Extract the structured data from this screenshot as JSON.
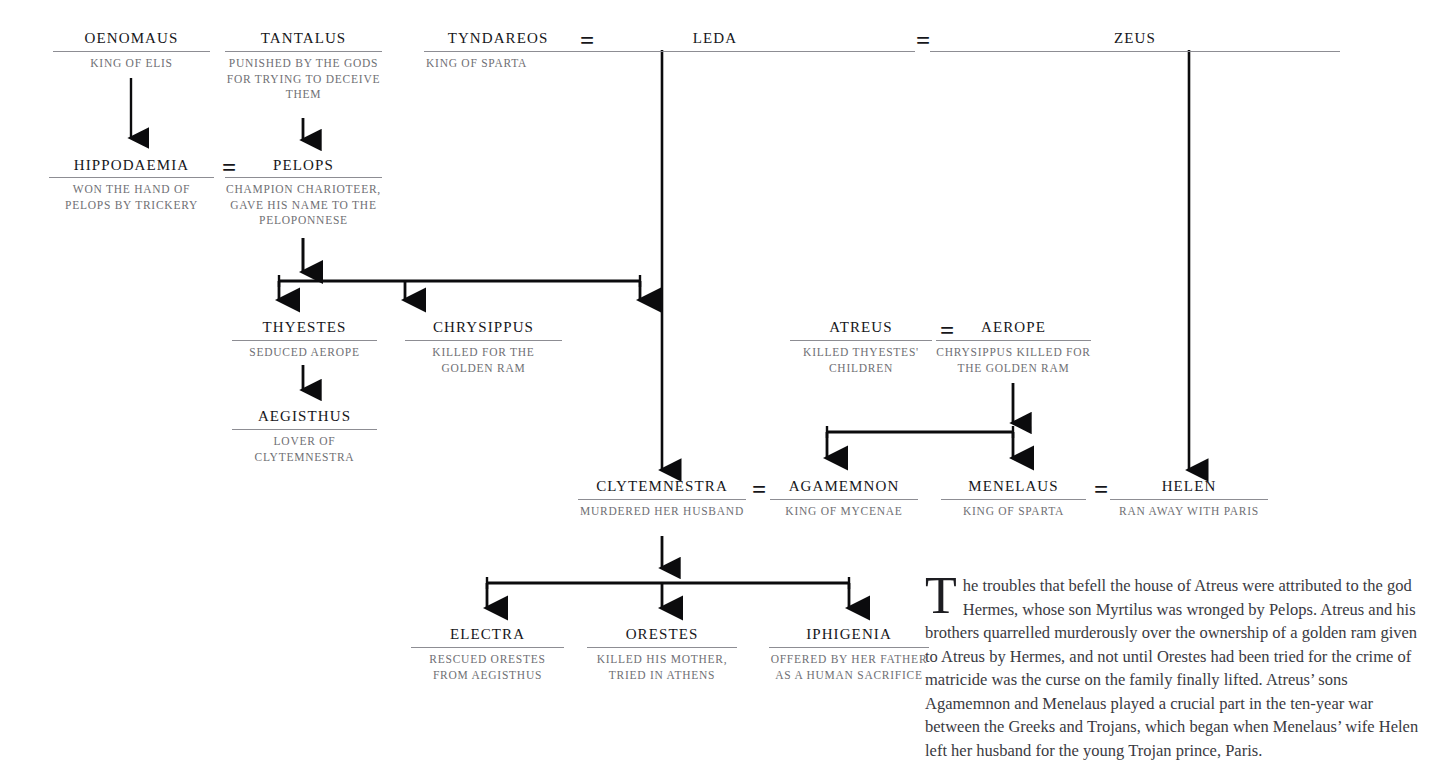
{
  "people": [
    {
      "id": "oenomaus",
      "name": "Oenomaus",
      "desc": "King of Elis"
    },
    {
      "id": "tantalus",
      "name": "Tantalus",
      "desc": "Punished by the gods for trying to deceive them"
    },
    {
      "id": "tyndareos",
      "name": "Tyndareos",
      "desc": "King of Sparta"
    },
    {
      "id": "leda",
      "name": "Leda",
      "desc": ""
    },
    {
      "id": "zeus",
      "name": "Zeus",
      "desc": ""
    },
    {
      "id": "hippodaemia",
      "name": "Hippodaemia",
      "desc": "Won the hand of Pelops by trickery"
    },
    {
      "id": "pelops",
      "name": "Pelops",
      "desc": "Champion charioteer, gave his name to the Peloponnese"
    },
    {
      "id": "thyestes",
      "name": "Thyestes",
      "desc": "Seduced Aerope"
    },
    {
      "id": "chrysippus",
      "name": "Chrysippus",
      "desc": "Killed for the golden ram"
    },
    {
      "id": "atreus",
      "name": "Atreus",
      "desc": "Killed Thyestes' children"
    },
    {
      "id": "aerope",
      "name": "Aerope",
      "desc": "Chrysippus killed for the golden ram"
    },
    {
      "id": "aegisthus",
      "name": "Aegisthus",
      "desc": "Lover of Clytemnestra"
    },
    {
      "id": "clytemnestra",
      "name": "Clytemnestra",
      "desc": "Murdered her husband"
    },
    {
      "id": "agamemnon",
      "name": "Agamemnon",
      "desc": "King of Mycenae"
    },
    {
      "id": "menelaus",
      "name": "Menelaus",
      "desc": "King of Sparta"
    },
    {
      "id": "helen",
      "name": "Helen",
      "desc": "Ran away with Paris"
    },
    {
      "id": "electra",
      "name": "Electra",
      "desc": "Rescued Orestes from Aegisthus"
    },
    {
      "id": "orestes",
      "name": "Orestes",
      "desc": "Killed his mother, tried in Athens"
    },
    {
      "id": "iphigenia",
      "name": "Iphigenia",
      "desc": "Offered by her father as a human sacrifice"
    }
  ],
  "marriages": [
    {
      "id": "tyndareos-leda",
      "symbol": "="
    },
    {
      "id": "leda-zeus",
      "symbol": "="
    },
    {
      "id": "hippodaemia-pelops",
      "symbol": "="
    },
    {
      "id": "atreus-aerope",
      "symbol": "="
    },
    {
      "id": "clytemnestra-agamemnon",
      "symbol": "="
    },
    {
      "id": "menelaus-helen",
      "symbol": "="
    }
  ],
  "narrative": {
    "dropcap": "T",
    "text": "he troubles that befell the house of Atreus were attributed to the god Hermes, whose son Myrtilus was wronged by Pelops. Atreus and his brothers quarrelled murderously over the ownership of a golden ram given to Atreus by Hermes, and not until Orestes had been tried for the crime of matricide was the curse on the family finally lifted. Atreus’ sons Agamemnon and Menelaus played a crucial part in the ten-year war between the Greeks and Trojans, which began when Menelaus’ wife Helen left her husband for the young Trojan prince, Paris."
  },
  "colors": {
    "name_text": "#16161a",
    "desc_text": "#6f6f74",
    "rule": "#8d8d93",
    "connector": "#0b0b0d",
    "body_text": "#3a3a3f",
    "background": "#ffffff"
  }
}
